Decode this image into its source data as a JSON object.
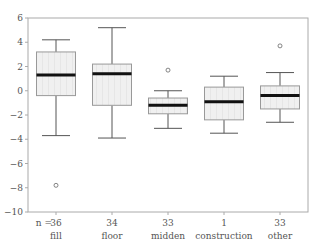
{
  "chart_data": {
    "type": "boxplot",
    "title": "",
    "xlabel": "",
    "ylabel": "",
    "ylim": [
      -10,
      6
    ],
    "yticks": [
      6,
      4,
      2,
      0,
      -2,
      -4,
      -6,
      -8,
      -10
    ],
    "ytick_labels": [
      "6",
      "4",
      "2",
      "0",
      "−2",
      "−4",
      "−6",
      "−8",
      "−10"
    ],
    "grid": false,
    "n_label": "n =",
    "categories": [
      "fill",
      "floor",
      "midden",
      "construction",
      "other"
    ],
    "n": [
      "36",
      "34",
      "33",
      "1",
      "33"
    ],
    "boxes": [
      {
        "name": "fill",
        "whisker_high": 4.2,
        "q3": 3.2,
        "median": 1.3,
        "q1": -0.4,
        "whisker_low": -3.7,
        "outliers": [
          -7.8
        ]
      },
      {
        "name": "floor",
        "whisker_high": 5.2,
        "q3": 2.2,
        "median": 1.4,
        "q1": -1.2,
        "whisker_low": -3.9,
        "outliers": []
      },
      {
        "name": "midden",
        "whisker_high": 0.0,
        "q3": -0.6,
        "median": -1.2,
        "q1": -1.9,
        "whisker_low": -3.1,
        "outliers": [
          1.7
        ]
      },
      {
        "name": "construction",
        "whisker_high": 1.2,
        "q3": 0.3,
        "median": -0.9,
        "q1": -2.4,
        "whisker_low": -3.5,
        "outliers": []
      },
      {
        "name": "other",
        "whisker_high": 1.5,
        "q3": 0.4,
        "median": -0.4,
        "q1": -1.5,
        "whisker_low": -2.6,
        "outliers": [
          3.7
        ]
      }
    ],
    "colors": {
      "box_fill": "#eeeeee",
      "box_stroke": "#999999",
      "median": "#111111",
      "whisker": "#555555",
      "axis": "#aaaaaa",
      "outlier": "#666666"
    }
  }
}
